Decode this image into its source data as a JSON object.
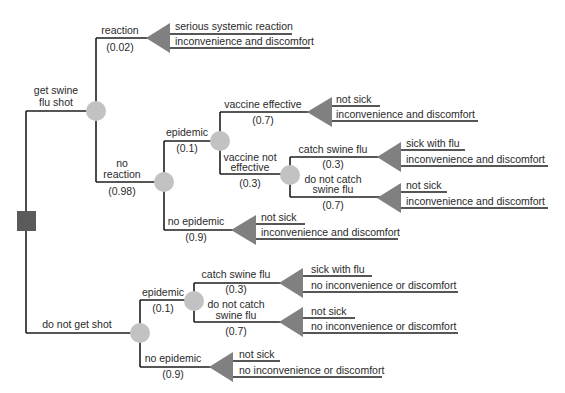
{
  "colors": {
    "line": "#1e1e1e",
    "decision_node": "#5a5a5a",
    "chance_node": "#c2c2c2",
    "terminal_node": "#808080",
    "text": "#2a2a2a"
  },
  "legend_shapes": {
    "decision": "square-icon",
    "chance": "circle-icon",
    "terminal": "triangle-icon"
  },
  "branches": {
    "get_shot": {
      "label_line1": "get swine",
      "label_line2": "flu shot"
    },
    "reaction": {
      "label": "reaction",
      "prob": "(0.02)"
    },
    "no_reaction": {
      "label_line1": "no",
      "label_line2": "reaction",
      "prob": "(0.98)"
    },
    "shot_epidemic": {
      "label": "epidemic",
      "prob": "(0.1)"
    },
    "shot_no_epidemic": {
      "label": "no epidemic",
      "prob": "(0.9)"
    },
    "vaccine_effective": {
      "label": "vaccine effective",
      "prob": "(0.7)"
    },
    "vaccine_not_effective": {
      "label_line1": "vaccine not",
      "label_line2": "effective",
      "prob": "(0.3)"
    },
    "vne_catch": {
      "label": "catch swine flu",
      "prob": "(0.3)"
    },
    "vne_no_catch": {
      "label_line1": "do not catch",
      "label_line2": "swine flu",
      "prob": "(0.7)"
    },
    "no_shot": {
      "label": "do not get shot"
    },
    "noshot_epidemic": {
      "label": "epidemic",
      "prob": "(0.1)"
    },
    "noshot_catch": {
      "label": "catch swine flu",
      "prob": "(0.3)"
    },
    "noshot_no_catch": {
      "label_line1": "do not catch",
      "label_line2": "swine flu",
      "prob": "(0.7)"
    },
    "noshot_no_epidemic": {
      "label": "no epidemic",
      "prob": "(0.9)"
    }
  },
  "outcomes": {
    "reaction": {
      "line1": "serious systemic reaction",
      "line2": "inconvenience and discomfort"
    },
    "vaccine_effective": {
      "line1": "not sick",
      "line2": "inconvenience and discomfort"
    },
    "vne_catch": {
      "line1": "sick with flu",
      "line2": "inconvenience and discomfort"
    },
    "vne_no_catch": {
      "line1": "not sick",
      "line2": "inconvenience and discomfort"
    },
    "shot_no_epidemic": {
      "line1": "not sick",
      "line2": "inconvenience and discomfort"
    },
    "noshot_catch": {
      "line1": "sick with flu",
      "line2": "no inconvenience or discomfort"
    },
    "noshot_no_catch": {
      "line1": "not sick",
      "line2": "no inconvenience or discomfort"
    },
    "noshot_no_epidemic": {
      "line1": "not sick",
      "line2": "no inconvenience or discomfort"
    }
  }
}
